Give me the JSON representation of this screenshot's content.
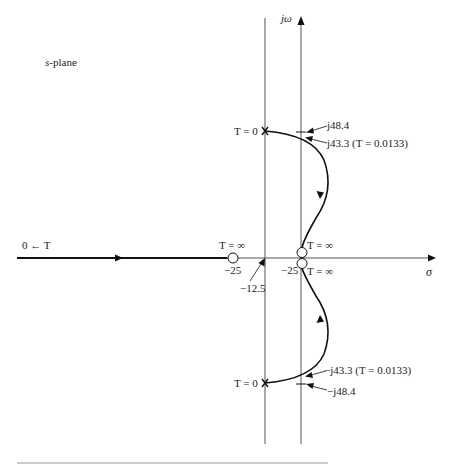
{
  "title": {
    "plane": "s-plane",
    "plane_italic": "s",
    "plane_rest": "-plane"
  },
  "axes": {
    "imag_label": "jω",
    "real_label": "σ"
  },
  "labels": {
    "start_neg_inf": "0 ← T",
    "zero_left_T": "T = ∞",
    "zero_left_value": "−25",
    "breakpoint": "−12.5",
    "zero_double_upper_T": "T = ∞",
    "zero_double_lower_T": "T = ∞",
    "zero_double_value": "−25",
    "pole_upper_T": "T = 0",
    "pole_lower_T": "T = 0",
    "upper_j48": "j48.4",
    "upper_j43": "j43.3 (T = 0.0133)",
    "lower_j43": "−j43.3 (T = 0.0133)",
    "lower_j48": "−j48.4"
  },
  "colors": {
    "locus": "#111111",
    "axis": "#555555",
    "text": "#222222"
  }
}
